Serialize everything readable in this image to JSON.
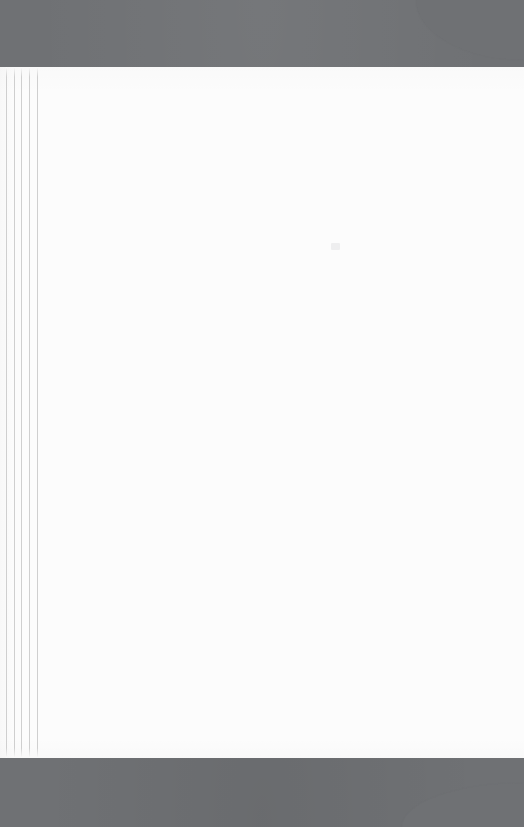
{
  "document": {
    "page_body_text": "",
    "artifact_label": "faint-ink-speck"
  },
  "canvas": {
    "width": 524,
    "height": 827
  },
  "colors": {
    "backdrop_gray": "#6f7174",
    "page_white": "#fcfcfc",
    "rule_line": "#cfcfcf"
  },
  "sheet": {
    "top": 67,
    "bottom": 758,
    "left": 0,
    "right": 524
  },
  "margin_rules": {
    "count": 5,
    "positions_px": [
      6,
      14,
      21,
      29,
      37
    ]
  },
  "corners": {
    "top_right": {
      "style": "rounded-cut",
      "width": 108,
      "height": 60
    },
    "bottom_right": {
      "style": "rounded-cut",
      "width": 122,
      "height": 44
    }
  }
}
